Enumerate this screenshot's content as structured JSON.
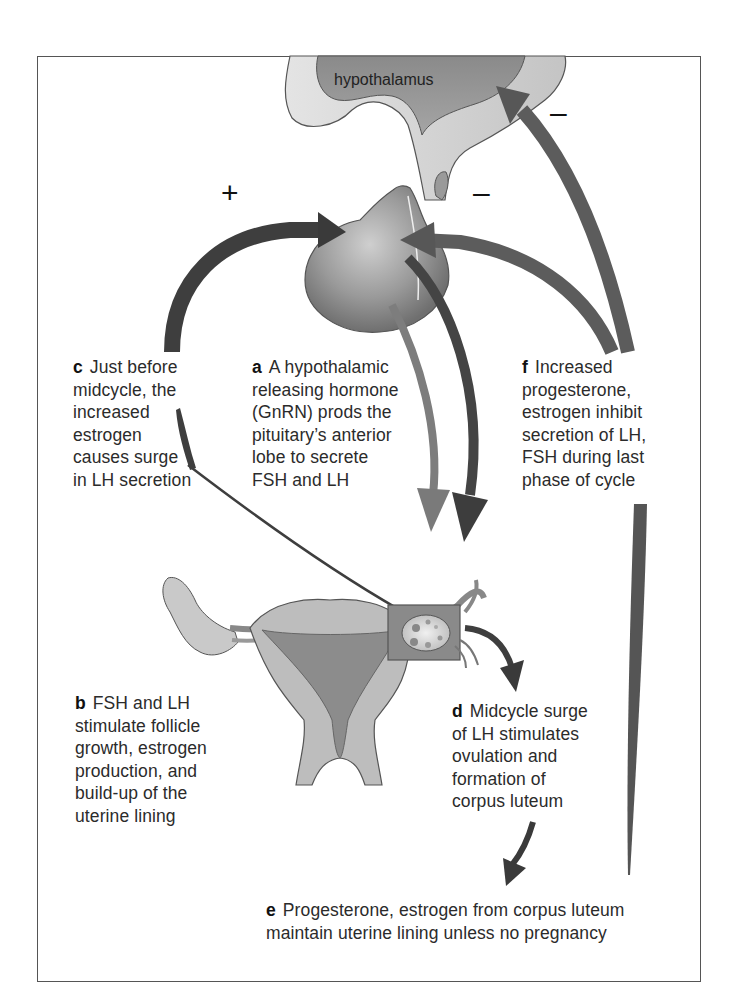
{
  "figure": {
    "title_region": "hypothalamus",
    "signs": {
      "plus": "+",
      "minus_upper": "–",
      "minus_lower": "–"
    },
    "colors": {
      "frame": "#555555",
      "arrow_dark": "#3a3a3a",
      "arrow_medium": "#5a5a5a",
      "arrow_light": "#7d7d7d",
      "tissue_light": "#d6d6d6",
      "tissue_mid": "#a8a8a8",
      "tissue_dark": "#7a7a7a"
    },
    "labels": {
      "a": {
        "letter": "a",
        "lines": [
          "A hypothalamic",
          "releasing hormone",
          "(GnRN) prods the",
          "pituitary’s anterior",
          "lobe to secrete",
          "FSH and LH"
        ]
      },
      "b": {
        "letter": "b",
        "lines": [
          "FSH and LH",
          "stimulate follicle",
          "growth, estrogen",
          "production, and",
          "build-up of the",
          "uterine lining"
        ]
      },
      "c": {
        "letter": "c",
        "lines": [
          "Just before",
          "midcycle, the",
          "increased",
          "estrogen",
          "causes surge",
          "in LH secretion"
        ]
      },
      "d": {
        "letter": "d",
        "lines": [
          "Midcycle surge",
          "of LH stimulates",
          "ovulation and",
          "formation of",
          "corpus luteum"
        ]
      },
      "e": {
        "letter": "e",
        "lines": [
          "Progesterone, estrogen from corpus luteum",
          "maintain uterine lining unless no pregnancy"
        ]
      },
      "f": {
        "letter": "f",
        "lines": [
          "Increased",
          "progesterone,",
          "estrogen inhibit",
          "secretion of LH,",
          "FSH during last",
          "phase of cycle"
        ]
      }
    }
  }
}
